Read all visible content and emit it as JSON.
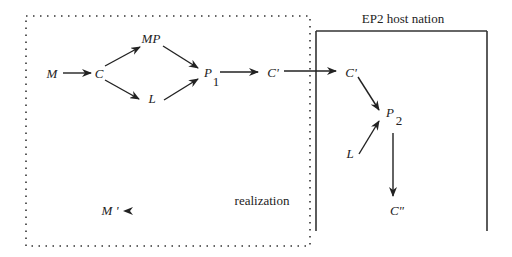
{
  "diagram": {
    "host_box_title": "EP2 host nation",
    "flow_label": "realization",
    "nodes": {
      "M": {
        "label": "M"
      },
      "C": {
        "label": "C"
      },
      "MP": {
        "label": "MP"
      },
      "L1": {
        "label": "L"
      },
      "P1": {
        "label": "P",
        "subscript": "1"
      },
      "C1": {
        "label": "C'"
      },
      "C2": {
        "label": "C'"
      },
      "P2": {
        "label": "P",
        "subscript": "2"
      },
      "L2": {
        "label": "L"
      },
      "C3": {
        "label": "C\""
      },
      "M2": {
        "label": "M '"
      }
    },
    "edges": [
      {
        "from": "M",
        "to": "C"
      },
      {
        "from": "C",
        "to": "MP"
      },
      {
        "from": "C",
        "to": "L1"
      },
      {
        "from": "MP",
        "to": "P1"
      },
      {
        "from": "L1",
        "to": "P1"
      },
      {
        "from": "P1",
        "to": "C1"
      },
      {
        "from": "C1",
        "to": "C2"
      },
      {
        "from": "C2",
        "to": "P2"
      },
      {
        "from": "L2",
        "to": "P2"
      },
      {
        "from": "P2",
        "to": "C3"
      },
      {
        "from": "C3",
        "to": "M2",
        "label": "realization"
      }
    ]
  }
}
